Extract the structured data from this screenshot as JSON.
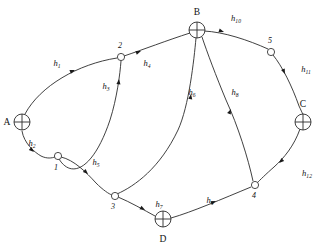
{
  "diagram": {
    "type": "directed-graph",
    "background_color": "#ffffff",
    "line_color": "#2b2b2b",
    "text_color": "#111111",
    "terminal_nodes": [
      {
        "id": "A",
        "label": "A",
        "glyph": "crossed-circle",
        "x": 22,
        "y": 122,
        "r": 8,
        "label_x": 7,
        "label_y": 125,
        "label_anchor": "middle"
      },
      {
        "id": "B",
        "label": "B",
        "glyph": "crossed-circle",
        "x": 197,
        "y": 30,
        "r": 8,
        "label_x": 197,
        "label_y": 15,
        "label_anchor": "middle"
      },
      {
        "id": "C",
        "label": "C",
        "glyph": "crossed-circle",
        "x": 303,
        "y": 122,
        "r": 8,
        "label_x": 303,
        "label_y": 107,
        "label_anchor": "middle"
      },
      {
        "id": "D",
        "label": "D",
        "glyph": "crossed-circle",
        "x": 163,
        "y": 219,
        "r": 8,
        "label_x": 163,
        "label_y": 242,
        "label_anchor": "middle"
      }
    ],
    "internal_nodes": [
      {
        "id": "1",
        "label": "1",
        "glyph": "open-circle",
        "x": 58,
        "y": 156,
        "r": 3.6,
        "label_x": 56,
        "label_y": 170,
        "label_anchor": "middle"
      },
      {
        "id": "2",
        "label": "2",
        "glyph": "open-circle",
        "x": 121,
        "y": 57,
        "r": 3.6,
        "label_x": 120,
        "label_y": 48,
        "label_anchor": "middle"
      },
      {
        "id": "3",
        "label": "3",
        "glyph": "open-circle",
        "x": 115,
        "y": 196,
        "r": 3.6,
        "label_x": 113,
        "label_y": 209,
        "label_anchor": "middle"
      },
      {
        "id": "4",
        "label": "4",
        "glyph": "open-circle",
        "x": 255,
        "y": 185,
        "r": 3.6,
        "label_x": 254,
        "label_y": 198,
        "label_anchor": "middle"
      },
      {
        "id": "5",
        "label": "5",
        "glyph": "open-circle",
        "x": 271,
        "y": 52,
        "r": 3.6,
        "label_x": 270,
        "label_y": 43,
        "label_anchor": "middle"
      }
    ],
    "edges": [
      {
        "id": "h1",
        "label": "h",
        "sub": "1",
        "from": "A",
        "to": "2",
        "path": "M 25 114 C 40 86, 78 64, 117 58",
        "label_x": 57,
        "label_y": 66,
        "arrow_x": 75,
        "arrow_y": 70,
        "arrow_angle": -22
      },
      {
        "id": "h2",
        "label": "h",
        "sub": "2",
        "from": "A",
        "to": "1",
        "path": "M 22 131 C 24 143, 34 152, 41 156 C 47 159, 52 158, 55 157",
        "label_x": 32,
        "label_y": 146,
        "arrow_x": 34,
        "arrow_y": 152,
        "arrow_angle": 42
      },
      {
        "id": "h3",
        "label": "h",
        "sub": "3",
        "from": "1",
        "to": "2",
        "path": "M 59 159 C 72 180, 94 168, 110 120 C 117 98, 120 74, 121 61",
        "label_x": 106,
        "label_y": 89,
        "arrow_x": 119,
        "arrow_y": 79,
        "arrow_angle": -84
      },
      {
        "id": "h4",
        "label": "h",
        "sub": "4",
        "from": "2",
        "to": "B",
        "path": "M 124 56 C 142 50, 168 40, 190 33",
        "label_x": 147,
        "label_y": 66,
        "arrow_x": 141,
        "arrow_y": 51,
        "arrow_angle": -20
      },
      {
        "id": "h5",
        "label": "h",
        "sub": "5",
        "from": "1",
        "to": "3",
        "path": "M 61 157 C 74 160, 86 172, 96 183 C 103 190, 109 194, 112 195",
        "label_x": 96,
        "label_y": 165,
        "arrow_x": 88,
        "arrow_y": 174,
        "arrow_angle": 43
      },
      {
        "id": "h6",
        "label": "h",
        "sub": "6",
        "from": "3",
        "to": "B",
        "path": "M 117 194 C 135 186, 160 168, 178 130 C 189 106, 194 60, 196 38",
        "label_x": 192,
        "label_y": 95,
        "arrow_x": 191,
        "arrow_y": 94,
        "arrow_angle": -82
      },
      {
        "id": "h7",
        "label": "h",
        "sub": "7",
        "from": "3",
        "to": "D",
        "path": "M 118 197 C 130 202, 144 210, 155 216",
        "label_x": 159,
        "label_y": 207,
        "arrow_x": 145,
        "arrow_y": 210,
        "arrow_angle": 30
      },
      {
        "id": "h8",
        "label": "h",
        "sub": "8",
        "from": "4",
        "to": "B",
        "path": "M 253 181 C 248 158, 238 126, 226 100 C 216 76, 207 52, 202 37",
        "label_x": 235,
        "label_y": 95,
        "arrow_x": 231,
        "arrow_y": 109,
        "arrow_angle": -67
      },
      {
        "id": "h9",
        "label": "h",
        "sub": "9",
        "from": "D",
        "to": "4",
        "path": "M 171 218 C 192 212, 222 199, 251 187",
        "label_x": 210,
        "label_y": 203,
        "arrow_x": 216,
        "arrow_y": 201,
        "arrow_angle": -23
      },
      {
        "id": "h10",
        "label": "h",
        "sub": "10",
        "from": "B",
        "to": "5",
        "path": "M 204 31 C 224 32, 248 40, 268 49",
        "label_x": 236,
        "label_y": 21,
        "arrow_x": 224,
        "arrow_y": 32,
        "arrow_angle": 19
      },
      {
        "id": "h11",
        "label": "h",
        "sub": "11",
        "from": "5",
        "to": "C",
        "path": "M 273 55 C 282 66, 292 86, 299 106 C 301 110, 302 113, 303 114",
        "label_x": 306,
        "label_y": 72,
        "arrow_x": 285,
        "arrow_y": 74,
        "arrow_angle": 66
      },
      {
        "id": "h12",
        "label": "h",
        "sub": "12",
        "from": "C",
        "to": "4",
        "path": "M 300 129 C 294 146, 284 158, 274 167 C 266 174, 260 180, 257 183",
        "label_x": 307,
        "label_y": 176,
        "arrow_x": 279,
        "arrow_y": 163,
        "arrow_angle": 137
      }
    ]
  }
}
